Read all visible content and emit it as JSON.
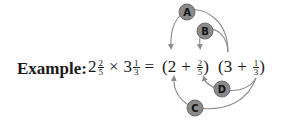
{
  "example_label": "Example:",
  "expression": {
    "lhs": {
      "term1": {
        "whole": "2",
        "num": "2",
        "den": "5"
      },
      "times": "×",
      "term2": {
        "whole": "3",
        "num": "1",
        "den": "3"
      },
      "equals": "="
    },
    "rhs": {
      "group1": {
        "open": "(",
        "whole": "2",
        "plus": "+",
        "num": "2",
        "den": "5",
        "close": ")"
      },
      "group2": {
        "open": "(",
        "whole": "3",
        "plus": "+",
        "num": "1",
        "den": "3",
        "close": ")"
      }
    }
  },
  "callouts": [
    {
      "label": "A",
      "from": "3",
      "to": "2"
    },
    {
      "label": "B",
      "from": "3",
      "to": "2/5"
    },
    {
      "label": "C",
      "from": "1/3",
      "to": "2"
    },
    {
      "label": "D",
      "from": "1/3",
      "to": "2/5"
    }
  ],
  "colors": {
    "bubble_fill": "#8a8a8a",
    "bubble_stroke": "#6e6e6e",
    "arrow": "#8c8c8c",
    "text": "#1a1a1a"
  }
}
